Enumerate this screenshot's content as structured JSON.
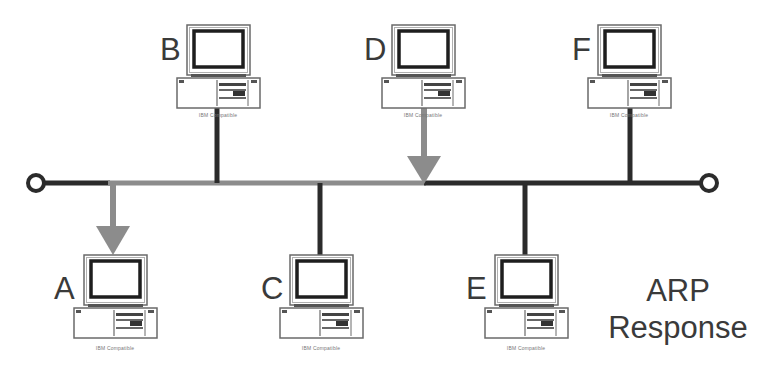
{
  "title": {
    "line1": "ARP",
    "line2": "Response"
  },
  "colors": {
    "bus_dark": "#2b2b2b",
    "bus_highlight": "#8c8c8c",
    "arrow": "#8c8c8c",
    "text": "#3a3a3a"
  },
  "nodes": [
    {
      "id": "A",
      "label": "A",
      "caption": "IBM Compatible",
      "position": "bottom",
      "connection": "arrow-from-bus"
    },
    {
      "id": "B",
      "label": "B",
      "caption": "IBM Compatible",
      "position": "top",
      "connection": "line"
    },
    {
      "id": "C",
      "label": "C",
      "caption": "IBM Compatible",
      "position": "bottom",
      "connection": "line"
    },
    {
      "id": "D",
      "label": "D",
      "caption": "IBM Compatible",
      "position": "top",
      "connection": "arrow-to-bus"
    },
    {
      "id": "E",
      "label": "E",
      "caption": "IBM Compatible",
      "position": "bottom",
      "connection": "line"
    },
    {
      "id": "F",
      "label": "F",
      "caption": "IBM Compatible",
      "position": "top",
      "connection": "line"
    }
  ],
  "bus": {
    "terminators": [
      "left",
      "right"
    ],
    "highlighted_segment": "D to A"
  }
}
